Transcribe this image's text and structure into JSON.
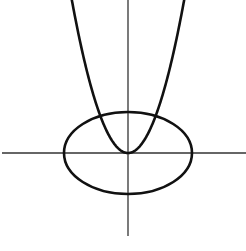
{
  "figure": {
    "width": 246,
    "height": 251,
    "background": "#ffffff",
    "stroke_color": "#111111",
    "axis_color": "#333333",
    "curve_stroke_width": 2.6,
    "axis_stroke_width": 1.3
  },
  "axes": {
    "origin": {
      "x": 128,
      "y": 153
    },
    "x_axis": {
      "x1": 2,
      "x2": 246,
      "y": 153
    },
    "y_axis": {
      "x": 128,
      "y1": 0,
      "y2": 236
    }
  },
  "ellipse": {
    "cx": 128,
    "cy": 153,
    "rx": 64,
    "ry": 41
  },
  "parabola": {
    "vertex": {
      "x": 128,
      "y": 153
    },
    "k": 0.0485,
    "x_min": 70,
    "x_max": 186,
    "opens": "up"
  }
}
